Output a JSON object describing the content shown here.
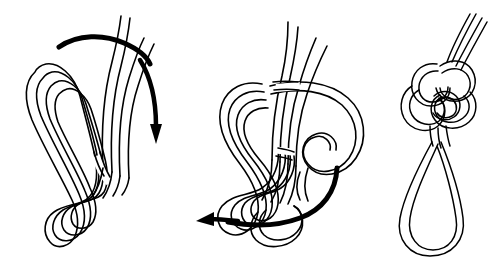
{
  "document": {
    "type": "instructional-line-diagram",
    "subject": "knot-tying-sequence",
    "background_color": "#ffffff",
    "ink_color": "#000000",
    "width": 499,
    "height": 266,
    "panel_count": 3,
    "text_labels": [],
    "caption": ""
  },
  "panels": [
    {
      "id": "panel-1",
      "name": "step-one",
      "label": "",
      "bounds": {
        "x": 8,
        "y": 8,
        "width": 170,
        "height": 250
      },
      "description": "Doubled rope with four strand lines rising at upper right and a long bight loop at left, crossed once near the bottom into a small double eye.",
      "strand_line_count": 4,
      "loop_count": 2,
      "arrow": {
        "name": "motion-arrow-down-right",
        "direction": "clockwise-over-to-right",
        "start": [
          60,
          40
        ],
        "end": [
          155,
          141
        ],
        "head_angle_deg": 100,
        "stroke_width": 5
      }
    },
    {
      "id": "panel-2",
      "name": "step-two",
      "label": "",
      "bounds": {
        "x": 196,
        "y": 8,
        "width": 176,
        "height": 250
      },
      "description": "The bight has been carried over and around the standing parts forming a large loop to the right, with the lower crossing still open.",
      "strand_line_count": 4,
      "loop_count": 3,
      "arrow": {
        "name": "motion-arrow-left",
        "direction": "counter-clockwise-to-left",
        "start": [
          337,
          168
        ],
        "end": [
          202,
          224
        ],
        "head_angle_deg": 200,
        "stroke_width": 5
      }
    },
    {
      "id": "panel-3",
      "name": "step-three",
      "label": "",
      "bounds": {
        "x": 392,
        "y": 8,
        "width": 100,
        "height": 250
      },
      "description": "The finished knot drawn tight at the top with a single long pear-shaped loop hanging below.",
      "strand_line_count": 3,
      "loop_count": 1,
      "arrow": null
    }
  ],
  "legend": {
    "arrow_meaning": "direction to pull or pass the rope",
    "entries": []
  }
}
